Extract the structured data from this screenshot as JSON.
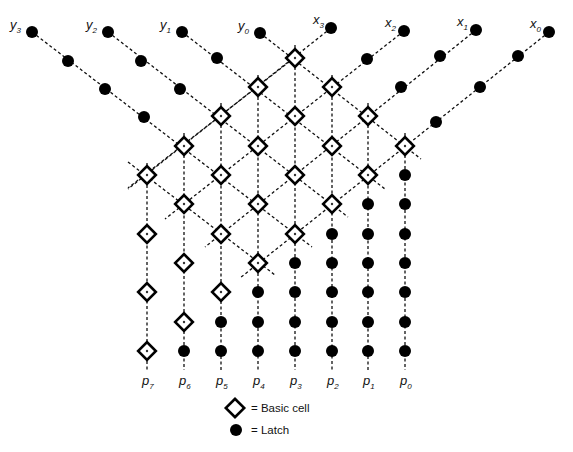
{
  "diagram": {
    "columns": {
      "x": [
        147,
        184,
        221,
        258,
        295,
        332,
        368,
        405
      ],
      "labels": [
        "p7",
        "p6",
        "p5",
        "p4",
        "p3",
        "p2",
        "p1",
        "p0"
      ],
      "label_base": [
        "p",
        "p",
        "p",
        "p",
        "p",
        "p",
        "p",
        "p"
      ],
      "label_sub": [
        "7",
        "6",
        "5",
        "4",
        "3",
        "2",
        "1",
        "0"
      ],
      "label_y": 385,
      "vertical_top_y": [
        163,
        133,
        103,
        75,
        45,
        75,
        103,
        133
      ],
      "vertical_bottom_y": 370
    },
    "rows_y": [
      58,
      87,
      116,
      146,
      175,
      204,
      234,
      263,
      292,
      322,
      351
    ],
    "basic_cells": [
      [
        4,
        0
      ],
      [
        3,
        1
      ],
      [
        5,
        1
      ],
      [
        2,
        2
      ],
      [
        4,
        2
      ],
      [
        6,
        2
      ],
      [
        1,
        3
      ],
      [
        3,
        3
      ],
      [
        5,
        3
      ],
      [
        7,
        3
      ],
      [
        0,
        4
      ],
      [
        2,
        4
      ],
      [
        4,
        4
      ],
      [
        6,
        4
      ],
      [
        1,
        5
      ],
      [
        3,
        5
      ],
      [
        5,
        5
      ],
      [
        0,
        6
      ],
      [
        2,
        6
      ],
      [
        4,
        6
      ],
      [
        1,
        7
      ],
      [
        3,
        7
      ],
      [
        0,
        8
      ],
      [
        2,
        8
      ],
      [
        1,
        9
      ],
      [
        0,
        10
      ]
    ],
    "latch_cells": [
      [
        7,
        4
      ],
      [
        6,
        5
      ],
      [
        7,
        5
      ],
      [
        5,
        6
      ],
      [
        6,
        6
      ],
      [
        7,
        6
      ],
      [
        4,
        7
      ],
      [
        5,
        7
      ],
      [
        6,
        7
      ],
      [
        7,
        7
      ],
      [
        3,
        8
      ],
      [
        4,
        8
      ],
      [
        5,
        8
      ],
      [
        6,
        8
      ],
      [
        7,
        8
      ],
      [
        2,
        9
      ],
      [
        3,
        9
      ],
      [
        4,
        9
      ],
      [
        5,
        9
      ],
      [
        6,
        9
      ],
      [
        7,
        9
      ],
      [
        1,
        10
      ],
      [
        2,
        10
      ],
      [
        3,
        10
      ],
      [
        4,
        10
      ],
      [
        5,
        10
      ],
      [
        6,
        10
      ],
      [
        7,
        10
      ]
    ],
    "inputs_y": [
      {
        "name": "y0",
        "base": "y",
        "sub": "0",
        "latch": [
          260,
          33
        ],
        "label": [
          238,
          30
        ],
        "pipeline_latches": [],
        "line": [
          [
            260,
            33
          ],
          [
            421,
            159
          ]
        ]
      },
      {
        "name": "y1",
        "base": "y",
        "sub": "1",
        "latch": [
          182,
          32
        ],
        "label": [
          160,
          29
        ],
        "pipeline_latches": [
          [
            217,
            58
          ]
        ],
        "line": [
          [
            182,
            32
          ],
          [
            385,
            189
          ]
        ]
      },
      {
        "name": "y2",
        "base": "y",
        "sub": "2",
        "latch": [
          108,
          32
        ],
        "label": [
          86,
          29
        ],
        "pipeline_latches": [
          [
            141,
            61
          ],
          [
            180,
            89
          ]
        ],
        "line": [
          [
            108,
            32
          ],
          [
            348,
            217
          ]
        ]
      },
      {
        "name": "y3",
        "base": "y",
        "sub": "3",
        "latch": [
          32,
          32
        ],
        "label": [
          10,
          29
        ],
        "pipeline_latches": [
          [
            68,
            61
          ],
          [
            105,
            89
          ],
          [
            144,
            117
          ]
        ],
        "line": [
          [
            32,
            32
          ],
          [
            312,
            247
          ]
        ]
      }
    ],
    "extra_diagonals": [
      {
        "name": "carry-diagonal",
        "line": [
          [
            128,
            162
          ],
          [
            275,
            275
          ]
        ]
      },
      {
        "name": "x3-diagonal-tail",
        "line": [
          [
            294,
            58
          ],
          [
            128,
            188
          ]
        ]
      }
    ],
    "inputs_x": [
      {
        "name": "x3",
        "base": "x",
        "sub": "3",
        "latch": [
          331,
          28
        ],
        "label": [
          313,
          24
        ],
        "pipeline_latches": [],
        "line": [
          [
            331,
            28
          ],
          [
            128,
            189
          ]
        ]
      },
      {
        "name": "x2",
        "base": "x",
        "sub": "2",
        "latch": [
          404,
          31
        ],
        "label": [
          385,
          27
        ],
        "pipeline_latches": [
          [
            367,
            59
          ]
        ],
        "line": [
          [
            404,
            31
          ],
          [
            165,
            219
          ]
        ]
      },
      {
        "name": "x1",
        "base": "x",
        "sub": "1",
        "latch": [
          476,
          30
        ],
        "label": [
          457,
          26
        ],
        "pipeline_latches": [
          [
            440,
            56
          ],
          [
            401,
            87
          ]
        ],
        "line": [
          [
            476,
            30
          ],
          [
            205,
            247
          ]
        ]
      },
      {
        "name": "x0",
        "base": "x",
        "sub": "0",
        "latch": [
          549,
          32
        ],
        "label": [
          530,
          28
        ],
        "pipeline_latches": [
          [
            518,
            56
          ],
          [
            480,
            87
          ],
          [
            436,
            122
          ]
        ],
        "line": [
          [
            549,
            32
          ],
          [
            240,
            278
          ]
        ]
      }
    ],
    "legend": {
      "basic_cell_label": "= Basic cell",
      "latch_label": "= Latch",
      "basic_cell_pos": [
        235,
        408
      ],
      "latch_pos": [
        236,
        430
      ]
    },
    "colors": {
      "line": "#111111",
      "cell_stroke": "#000000",
      "latch_fill": "#000000",
      "background": "#ffffff"
    }
  }
}
